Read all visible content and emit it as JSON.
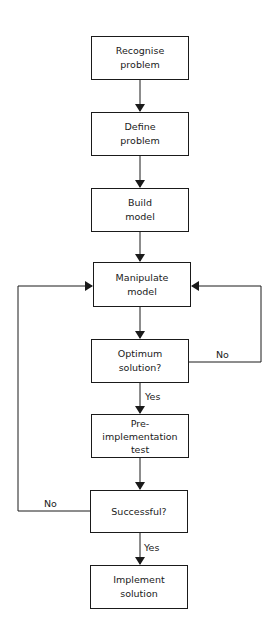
{
  "diagram": {
    "type": "flowchart",
    "nodes": [
      {
        "id": "recognise",
        "lines": [
          "Recognise",
          "problem"
        ]
      },
      {
        "id": "define",
        "lines": [
          "Define",
          "problem"
        ]
      },
      {
        "id": "build",
        "lines": [
          "Build",
          "model"
        ]
      },
      {
        "id": "manipulate",
        "lines": [
          "Manipulate",
          "model"
        ]
      },
      {
        "id": "optimum",
        "lines": [
          "Optimum",
          "solution?"
        ]
      },
      {
        "id": "pretest",
        "lines": [
          "Pre-",
          "implementation",
          "test"
        ]
      },
      {
        "id": "successful",
        "lines": [
          "Successful?"
        ]
      },
      {
        "id": "implement",
        "lines": [
          "Implement",
          "solution"
        ]
      }
    ],
    "edge_labels": {
      "optimum_no": "No",
      "optimum_yes": "Yes",
      "successful_no": "No",
      "successful_yes": "Yes"
    },
    "edges": [
      {
        "from": "recognise",
        "to": "define"
      },
      {
        "from": "define",
        "to": "build"
      },
      {
        "from": "build",
        "to": "manipulate"
      },
      {
        "from": "manipulate",
        "to": "optimum"
      },
      {
        "from": "optimum",
        "to": "pretest",
        "label": "Yes"
      },
      {
        "from": "optimum",
        "to": "manipulate",
        "label": "No"
      },
      {
        "from": "pretest",
        "to": "successful"
      },
      {
        "from": "successful",
        "to": "implement",
        "label": "Yes"
      },
      {
        "from": "successful",
        "to": "manipulate",
        "label": "No"
      }
    ]
  }
}
